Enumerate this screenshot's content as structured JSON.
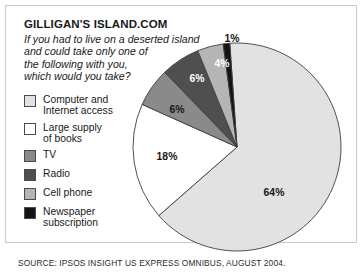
{
  "title": "GILLIGAN'S ISLAND.COM",
  "question_lines": [
    "If you had to live on a deserted island",
    "and could take only one of",
    "the following with you,",
    "which would you take?"
  ],
  "source": "SOURCE: IPSOS INSIGHT US EXPRESS OMNIBUS, AUGUST 2004.",
  "legend": [
    {
      "label_lines": [
        "Computer and",
        "Internet access"
      ],
      "color": "#e2e2e2"
    },
    {
      "label_lines": [
        "Large supply",
        "of books"
      ],
      "color": "#ffffff"
    },
    {
      "label_lines": [
        "TV"
      ],
      "color": "#8a8a8a"
    },
    {
      "label_lines": [
        "Radio"
      ],
      "color": "#4f4f4f"
    },
    {
      "label_lines": [
        "Cell phone"
      ],
      "color": "#b5b5b5"
    },
    {
      "label_lines": [
        "Newspaper",
        "subscription"
      ],
      "color": "#141414"
    }
  ],
  "chart_data": {
    "type": "pie",
    "title": "GILLIGAN'S ISLAND.COM",
    "subtitle": "If you had to live on a deserted island and could take only one of the following with you, which would you take?",
    "legend_position": "left",
    "unit": "percent",
    "start_angle_deg": -4,
    "direction": "clockwise",
    "center": {
      "x": 237,
      "y": 147
    },
    "radius": 104,
    "categories": [
      "Computer and Internet access",
      "Large supply of books",
      "TV",
      "Radio",
      "Cell phone",
      "Newspaper subscription"
    ],
    "values": [
      64,
      18,
      6,
      6,
      4,
      1
    ],
    "labels": [
      "64%",
      "18%",
      "6%",
      "6%",
      "4%",
      "1%"
    ],
    "colors": [
      "#e2e2e2",
      "#ffffff",
      "#8a8a8a",
      "#4f4f4f",
      "#b5b5b5",
      "#141414"
    ],
    "label_positions": [
      {
        "text": "64%",
        "x": 274,
        "y": 196,
        "light": false
      },
      {
        "text": "18%",
        "x": 167,
        "y": 160,
        "light": false
      },
      {
        "text": "6%",
        "x": 177,
        "y": 113,
        "light": false
      },
      {
        "text": "6%",
        "x": 197,
        "y": 82,
        "light": true
      },
      {
        "text": "4%",
        "x": 222,
        "y": 67,
        "light": true
      },
      {
        "text": "1%",
        "x": 232,
        "y": 42,
        "light": false
      }
    ]
  }
}
